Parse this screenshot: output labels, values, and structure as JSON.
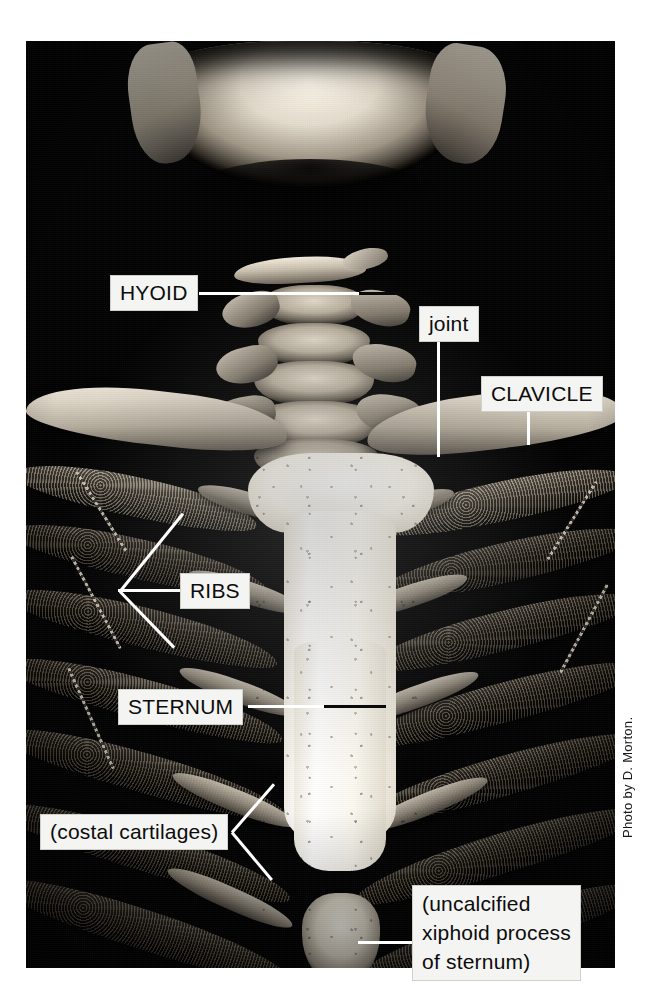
{
  "figure": {
    "photo_credit": "Photo by D. Morton."
  },
  "labels": [
    {
      "id": "hyoid",
      "text": "HYOID",
      "style": "uppercase"
    },
    {
      "id": "joint",
      "text": "joint",
      "style": "lowercase"
    },
    {
      "id": "clavicle",
      "text": "CLAVICLE",
      "style": "uppercase"
    },
    {
      "id": "ribs",
      "text": "RIBS",
      "style": "uppercase"
    },
    {
      "id": "sternum",
      "text": "STERNUM",
      "style": "uppercase"
    },
    {
      "id": "costal",
      "text": "(costal cartilages)",
      "style": "lowercase"
    },
    {
      "id": "xiphoid",
      "line1": "(uncalcified",
      "line2": "xiphoid process",
      "line3": "of sternum)",
      "style": "lowercase"
    }
  ],
  "colors": {
    "page_background": "#ffffff",
    "photo_background": "#030303",
    "label_background": "#f4f4f2",
    "label_text": "#0c0c0c",
    "leader_light": "#ffffff",
    "leader_dark": "#0a0a0a"
  }
}
